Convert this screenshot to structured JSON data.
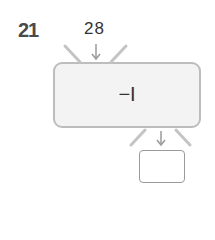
{
  "question_number": "21",
  "input_value": "28",
  "machine_rule": "−I",
  "answer_value": "",
  "colors": {
    "machine_fill": "#f3f3f3",
    "machine_border": "#bdbdbd",
    "arrow": "#9a9a9a"
  }
}
